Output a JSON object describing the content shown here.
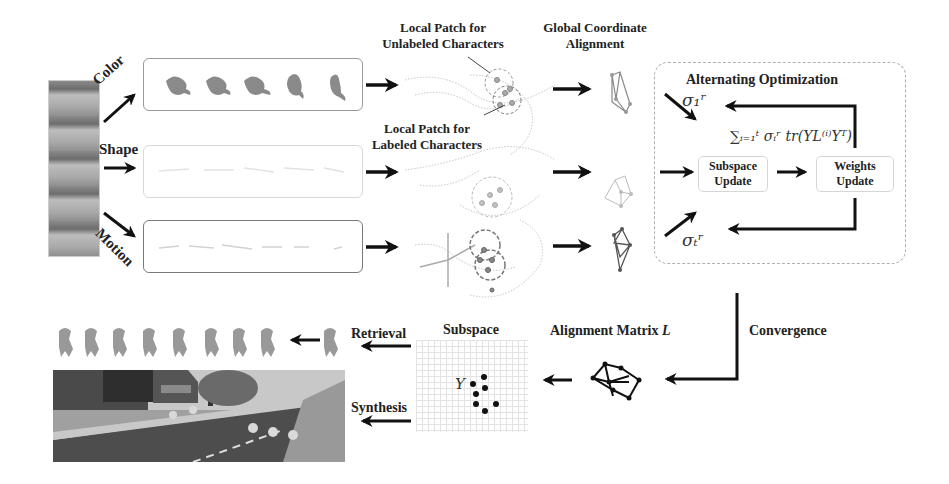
{
  "input": {
    "feature_labels": [
      "Color",
      "Shape",
      "Motion"
    ]
  },
  "patches": {
    "unlabeled_label_line1": "Local Patch for",
    "unlabeled_label_line2": "Unlabeled Characters",
    "labeled_label_line1": "Local Patch for",
    "labeled_label_line2": "Labeled Characters"
  },
  "alignment": {
    "title_line1": "Global Coordinate",
    "title_line2": "Alignment"
  },
  "optimization": {
    "title": "Alternating Optimization",
    "sigma_top": "σ₁ʳ",
    "sigma_bottom": "σₜʳ",
    "objective": "∑ᵢ₌₁ᵗ σᵢʳ tr(YL⁽ⁱ⁾Yᵀ)",
    "subspace_update_line1": "Subspace",
    "subspace_update_line2": "Update",
    "weights_update_line1": "Weights",
    "weights_update_line2": "Update"
  },
  "bottom": {
    "convergence": "Convergence",
    "alignment_matrix": "Alignment Matrix",
    "alignment_matrix_symbol": "L",
    "subspace": "Subspace",
    "subspace_symbol": "Y",
    "retrieval": "Retrieval",
    "synthesis": "Synthesis"
  }
}
